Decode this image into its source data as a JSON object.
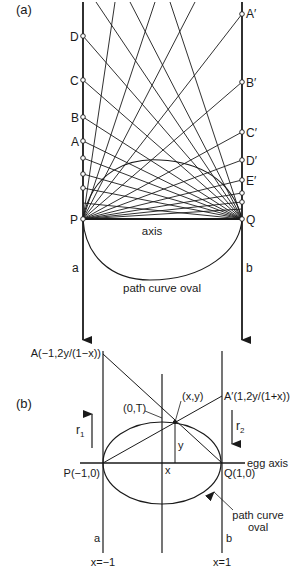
{
  "panel_a": {
    "tag": "(a)",
    "left_points": [
      "D",
      "C",
      "B",
      "A"
    ],
    "right_points": [
      "A′",
      "B′",
      "C′",
      "D′",
      "E′"
    ],
    "P": "P",
    "Q": "Q",
    "axis_label": "axis",
    "line_a": "a",
    "line_b": "b",
    "oval_label": "path curve oval"
  },
  "panel_b": {
    "tag": "(b)",
    "point_A": "A(−1,2y/(1−x))",
    "point_A_prime": "A′(1,2y/(1+x))",
    "point_0T": "(0,T)",
    "point_xy": "(x,y)",
    "r1": "r",
    "r1_sub": "1",
    "r2": "r",
    "r2_sub": "2",
    "y_label": "y",
    "x_label": "x",
    "egg_axis": "egg axis",
    "P": "P(−1,0)",
    "Q": "Q(1,0)",
    "oval_label_1": "path curve",
    "oval_label_2": "oval",
    "line_a": "a",
    "line_b": "b",
    "x_left": "x=−1",
    "x_right": "x=1"
  },
  "colors": {
    "ink": "#1a1a1a",
    "background": "#ffffff"
  }
}
